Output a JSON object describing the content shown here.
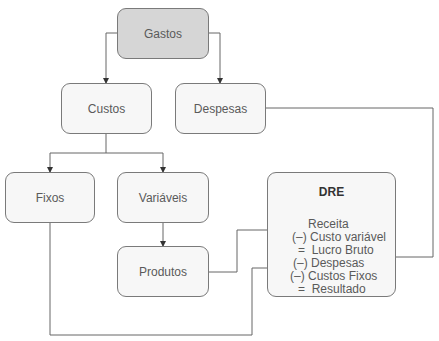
{
  "nodes": {
    "gastos": "Gastos",
    "custos": "Custos",
    "despesas": "Despesas",
    "fixos": "Fixos",
    "variaveis": "Variáveis",
    "produtos": "Produtos"
  },
  "dre": {
    "title": "DRE",
    "lines": [
      "Receita",
      "(–) Custo variável",
      "=  Lucro Bruto",
      "(–) Despesas",
      "(–) Custos Fixos",
      "=  Resultado"
    ]
  },
  "colors": {
    "line": "#555555",
    "root_fill": "#d6d6d6",
    "node_fill": "#f7f7f7",
    "border": "#7a7a7a"
  }
}
